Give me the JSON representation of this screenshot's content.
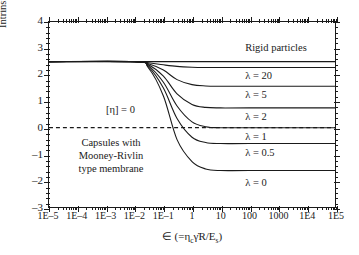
{
  "chart_data": {
    "type": "line",
    "title": "",
    "xlabel": "∈ (=ηcγ̇R/Es)",
    "ylabel": "Intrinsic viscosity, [η]",
    "xscale": "log",
    "xlim": [
      1e-05,
      100000.0
    ],
    "ylim": [
      -3,
      4
    ],
    "grid": false,
    "legend_position": "inline-right",
    "xticks": [
      "1E–5",
      "1E–4",
      "1E–3",
      "1E–2",
      "1E–1",
      "1",
      "10",
      "100",
      "1000",
      "1E4",
      "1E5"
    ],
    "xtick_values": [
      1e-05,
      0.0001,
      0.001,
      0.01,
      0.1,
      1,
      10,
      100,
      1000,
      10000,
      100000
    ],
    "yticks": [
      "4",
      "3",
      "2",
      "1",
      "0",
      "–1",
      "–2",
      "–3"
    ],
    "ytick_values": [
      4,
      3,
      2,
      1,
      0,
      -1,
      -2,
      -3
    ],
    "series": [
      {
        "name": "Rigid particles",
        "label": "Rigid particles",
        "plateau_low": 2.5,
        "plateau_high": 2.5,
        "x": [
          1e-05,
          0.001,
          0.01,
          0.1,
          1,
          10,
          100,
          1000,
          100000.0
        ],
        "values": [
          2.5,
          2.5,
          2.5,
          2.5,
          2.5,
          2.5,
          2.5,
          2.5,
          2.5
        ]
      },
      {
        "name": "lambda-20",
        "label": "λ = 20",
        "plateau_low": 2.5,
        "plateau_high": 2.28,
        "x": [
          1e-05,
          0.01,
          0.03,
          0.1,
          0.3,
          1,
          3,
          10,
          100,
          100000.0
        ],
        "values": [
          2.5,
          2.5,
          2.46,
          2.38,
          2.32,
          2.29,
          2.28,
          2.28,
          2.28,
          2.28
        ]
      },
      {
        "name": "lambda-5",
        "label": "λ = 5",
        "plateau_low": 2.5,
        "plateau_high": 1.57,
        "x": [
          1e-05,
          0.01,
          0.03,
          0.1,
          0.3,
          1,
          3,
          10,
          100,
          100000.0
        ],
        "values": [
          2.5,
          2.5,
          2.42,
          2.18,
          1.82,
          1.63,
          1.58,
          1.57,
          1.57,
          1.57
        ]
      },
      {
        "name": "lambda-2",
        "label": "λ = 2",
        "plateau_low": 2.5,
        "plateau_high": 0.75,
        "x": [
          1e-05,
          0.01,
          0.03,
          0.1,
          0.3,
          1,
          3,
          10,
          100,
          100000.0
        ],
        "values": [
          2.5,
          2.5,
          2.38,
          1.95,
          1.28,
          0.88,
          0.77,
          0.75,
          0.75,
          0.75
        ]
      },
      {
        "name": "lambda-1",
        "label": "λ = 1",
        "plateau_low": 2.5,
        "plateau_high": 0.0,
        "x": [
          1e-05,
          0.01,
          0.03,
          0.1,
          0.3,
          1,
          3,
          10,
          100,
          100000.0
        ],
        "values": [
          2.5,
          2.5,
          2.34,
          1.72,
          0.82,
          0.22,
          0.04,
          0.0,
          0.0,
          0.0
        ]
      },
      {
        "name": "lambda-0.5",
        "label": "λ = 0.5",
        "plateau_low": 2.5,
        "plateau_high": -0.6,
        "x": [
          1e-05,
          0.01,
          0.03,
          0.1,
          0.3,
          1,
          3,
          10,
          100,
          100000.0
        ],
        "values": [
          2.5,
          2.5,
          2.3,
          1.5,
          0.35,
          -0.36,
          -0.56,
          -0.6,
          -0.6,
          -0.6
        ]
      },
      {
        "name": "lambda-0",
        "label": "λ = 0",
        "plateau_low": 2.5,
        "plateau_high": -1.62,
        "x": [
          1e-05,
          0.01,
          0.03,
          0.1,
          0.3,
          1,
          3,
          10,
          100,
          100000.0
        ],
        "values": [
          2.5,
          2.5,
          2.26,
          1.2,
          -0.45,
          -1.28,
          -1.56,
          -1.62,
          -1.62,
          -1.62
        ]
      }
    ],
    "reference_lines": [
      {
        "name": "zero-line",
        "label": "[η] = 0",
        "y": 0,
        "style": "dashed"
      }
    ],
    "annotations": [
      {
        "name": "zero-annotation",
        "text": "[η] = 0"
      },
      {
        "name": "capsule-note",
        "lines": [
          "Capsules with",
          "Mooney-Rivlin",
          "type membrane"
        ]
      }
    ]
  },
  "axis": {
    "xlabel_parts": {
      "eps": "∈",
      "open": " (=η",
      "sub_c": "c",
      "gammadot": "γ̇",
      "r": "R/E",
      "sub_s": "s",
      "close": ")"
    },
    "ylabel_text": "Intrinsic viscosity, [η]"
  },
  "notes": {
    "line1": "Capsules with",
    "line2": "Mooney-Rivlin",
    "line3": "type membrane",
    "zero": "[η] = 0"
  },
  "colors": {
    "line": "#1a1a1a",
    "background": "#ffffff",
    "axis": "#1a1a1a"
  }
}
